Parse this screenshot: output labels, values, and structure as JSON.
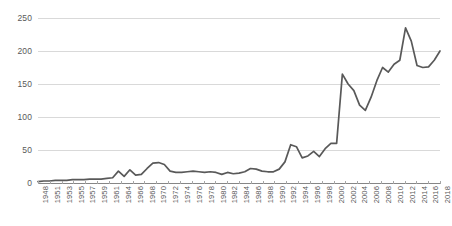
{
  "chart_data": {
    "type": "line",
    "title": "",
    "subtitle": "",
    "xlabel": "",
    "ylabel": "",
    "grid": true,
    "legend": false,
    "legend_position": "none",
    "line_color": "#595959",
    "gridline_color": "#d9d9d9",
    "axis_color": "#868686",
    "tick_label_color": "#595959",
    "xlim": [
      1948,
      2018
    ],
    "ylim": [
      0,
      250
    ],
    "yticks": [
      0,
      50,
      100,
      150,
      200,
      250
    ],
    "ytick_labels": [
      "0",
      "50",
      "100",
      "150",
      "200",
      "250"
    ],
    "xtick_labels": [
      "1948",
      "1951",
      "1953",
      "1955",
      "1957",
      "1959",
      "1961",
      "1964",
      "1966",
      "1968",
      "1970",
      "1972",
      "1974",
      "1976",
      "1978",
      "1980",
      "1982",
      "1984",
      "1986",
      "1988",
      "1990",
      "1992",
      "1994",
      "1996",
      "1998",
      "2000",
      "2002",
      "2004",
      "2006",
      "2008",
      "2010",
      "2012",
      "2014",
      "2016",
      "2018"
    ],
    "x": [
      1948,
      1949,
      1950,
      1951,
      1952,
      1953,
      1954,
      1955,
      1956,
      1957,
      1958,
      1959,
      1960,
      1961,
      1962,
      1963,
      1964,
      1965,
      1966,
      1967,
      1968,
      1969,
      1970,
      1971,
      1972,
      1973,
      1974,
      1975,
      1976,
      1977,
      1978,
      1979,
      1980,
      1981,
      1982,
      1983,
      1984,
      1985,
      1986,
      1987,
      1988,
      1989,
      1990,
      1991,
      1992,
      1993,
      1994,
      1995,
      1996,
      1997,
      1998,
      1999,
      2000,
      2001,
      2002,
      2003,
      2004,
      2005,
      2006,
      2007,
      2008,
      2009,
      2010,
      2011,
      2012,
      2013,
      2014,
      2015,
      2016,
      2017,
      2018
    ],
    "values": [
      2,
      3,
      3,
      4,
      4,
      4,
      5,
      5,
      5,
      6,
      6,
      6,
      7,
      8,
      18,
      10,
      20,
      12,
      13,
      22,
      30,
      31,
      28,
      18,
      16,
      16,
      17,
      18,
      17,
      16,
      17,
      16,
      13,
      16,
      14,
      15,
      17,
      22,
      21,
      18,
      17,
      17,
      21,
      32,
      58,
      55,
      38,
      41,
      48,
      40,
      52,
      60,
      60,
      165,
      150,
      140,
      118,
      110,
      130,
      155,
      175,
      168,
      180,
      186,
      235,
      215,
      178,
      175,
      176,
      186,
      200
    ]
  }
}
